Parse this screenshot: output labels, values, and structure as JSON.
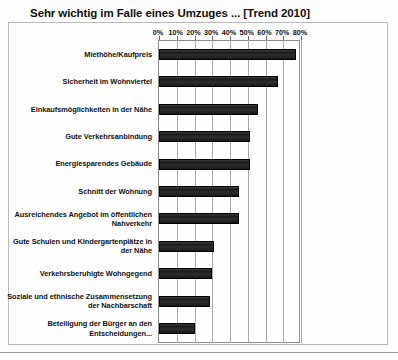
{
  "chart_data": {
    "type": "bar",
    "orientation": "horizontal",
    "title": "Sehr wichtig im Falle eines Umzuges ... [Trend 2010]",
    "xlabel": "",
    "ylabel": "",
    "xlim": [
      0,
      80
    ],
    "grid": true,
    "legend": "none",
    "tick_labels": [
      "0%",
      "10%",
      "20%",
      "30%",
      "40%",
      "50%",
      "60%",
      "70%",
      "80%"
    ],
    "tick_values": [
      0,
      10,
      20,
      30,
      40,
      50,
      60,
      70,
      80
    ],
    "categories": [
      "Miethöhe/Kaufpreis",
      "Sicherheit im Wohnviertel",
      "Einkaufsmöglichkeiten in der Nähe",
      "Gute Verkehrsanbindung",
      "Energiesparendes Gebäude",
      "Schnitt der Wohnung",
      "Ausreichendes Angebot im öffentlichen Nahverkehr",
      "Gute Schulen und Kindergartenplätze in der Nähe",
      "Verkehrsberuhigte Wohngegend",
      "Soziale und ethnische Zusammensetzung der Nachbarschaft",
      "Beteiligung der Bürger an den Entscheidungen..."
    ],
    "values": [
      77,
      67,
      56,
      51,
      51,
      45,
      45,
      31,
      30,
      29,
      20
    ],
    "bar_color": "#2b2b2b"
  }
}
